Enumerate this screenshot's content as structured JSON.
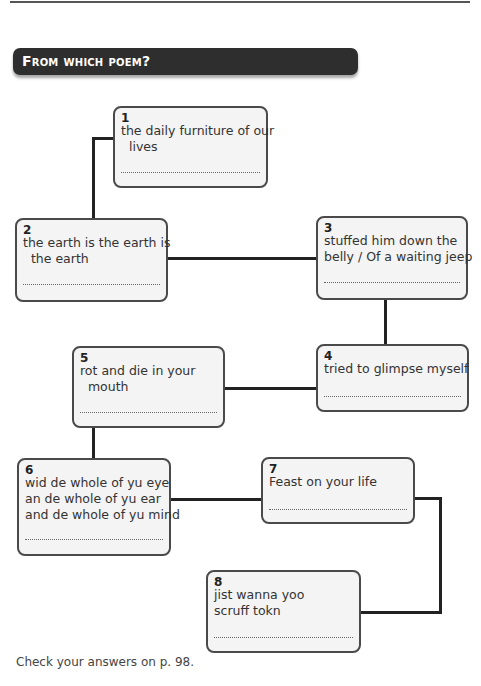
{
  "banner": {
    "title": "From which poem?"
  },
  "boxes": [
    {
      "number": "1",
      "text": "the daily furniture of our\n  lives"
    },
    {
      "number": "2",
      "text": "the earth is the earth is\n  the earth"
    },
    {
      "number": "3",
      "text": "stuffed him down the\nbelly / Of a waiting jeep"
    },
    {
      "number": "4",
      "text": "tried to glimpse myself"
    },
    {
      "number": "5",
      "text": "rot and die in your\n  mouth"
    },
    {
      "number": "6",
      "text": "wid de whole of yu eye\nan de whole of yu ear\nand de whole of yu mind"
    },
    {
      "number": "7",
      "text": "Feast on your life"
    },
    {
      "number": "8",
      "text": "jist wanna yoo\nscruff tokn"
    }
  ],
  "footer": {
    "text": "Check your answers on p. 98."
  },
  "colors": {
    "banner_bg": "#2e2e2e",
    "box_bg": "#f4f4f4",
    "connector": "#222222"
  }
}
